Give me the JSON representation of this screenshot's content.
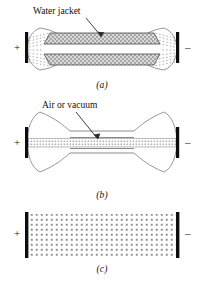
{
  "figure": {
    "title_present": false,
    "background_color": "#ffffff",
    "ink_color": "#111111",
    "electrode_color": "#0d0d0d",
    "texture_color": "#8c8c8c",
    "outline_color": "#8a8a8a"
  },
  "panels": [
    {
      "id": "a",
      "caption": "(a)",
      "callout": {
        "label": "Water jacket",
        "has_arrow": true,
        "arrow_points_to": "upper water jacket band"
      },
      "electrodes": [
        {
          "side": "left",
          "sign": "+",
          "polarity": "positive"
        },
        {
          "side": "right",
          "sign": "–",
          "polarity": "negative"
        }
      ],
      "beam_style": "fanning-dashed-rays",
      "bands": 2,
      "band_fill": "stippled-gray"
    },
    {
      "id": "b",
      "caption": "(b)",
      "callout": {
        "label": "Air or vacuum",
        "has_arrow": true,
        "arrow_points_to": "central tube region"
      },
      "electrodes": [
        {
          "side": "left",
          "sign": "+",
          "polarity": "positive"
        },
        {
          "side": "right",
          "sign": "–",
          "polarity": "negative"
        }
      ],
      "beam_style": "central-dotted-column",
      "bands": 1,
      "band_fill": "fine-dotted"
    },
    {
      "id": "c",
      "caption": "(c)",
      "callout": null,
      "electrodes": [
        {
          "side": "left",
          "sign": "+",
          "polarity": "positive"
        },
        {
          "side": "right",
          "sign": "–",
          "polarity": "negative"
        }
      ],
      "beam_style": "uniform-dotted-grid",
      "bands": 1,
      "band_fill": "dotted-grid"
    }
  ]
}
